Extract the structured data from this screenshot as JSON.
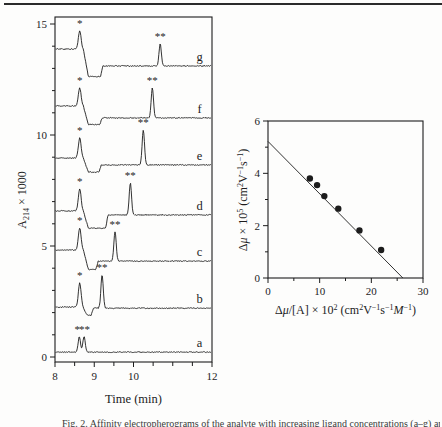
{
  "page": {
    "background": "#fdfdfc",
    "ink": "#1c1c1c",
    "caption": "Fig. 2. Affinity electropherograms of the analyte with increasing ligand concentrations (a–g) and the corresponding plot of Δμ versus Δμ/[A]."
  },
  "chart_data": [
    {
      "id": "affinity-electropherograms",
      "type": "line",
      "title": "",
      "xlabel": "Time (min)",
      "ylabel": "A214 × 1000",
      "xlim": [
        8,
        12
      ],
      "ylim": [
        0,
        15
      ],
      "xticks": [
        8,
        9,
        10,
        12
      ],
      "xticks_minor_step": 0.5,
      "yticks": [
        0,
        5,
        10,
        15
      ],
      "yticks_minor_step": 1,
      "grid": false,
      "ylabel_parts": [
        {
          "t": "A"
        },
        {
          "t": "214",
          "sub": true
        },
        {
          "t": " × 1000"
        }
      ],
      "traces": [
        {
          "label": "a",
          "baseline_left": 0.22,
          "baseline_right": 0.22,
          "dip": null,
          "peaks": [
            {
              "t": 8.62,
              "h": 0.7,
              "sigma": 0.03
            },
            {
              "t": 8.74,
              "h": 0.7,
              "sigma": 0.03
            }
          ],
          "markers": [
            {
              "t": 8.57,
              "glyph": "*"
            },
            {
              "t": 8.75,
              "glyph": "**"
            }
          ]
        },
        {
          "label": "b",
          "baseline_left": 2.25,
          "baseline_right": 2.2,
          "dip": {
            "start": 8.7,
            "end": 8.98,
            "depth": 0.32
          },
          "peaks": [
            {
              "t": 8.63,
              "h": 1.08,
              "sigma": 0.035
            },
            {
              "t": 9.2,
              "h": 1.49,
              "sigma": 0.03
            }
          ],
          "markers": [
            {
              "t": 8.63,
              "glyph": "*"
            },
            {
              "t": 9.2,
              "glyph": "**"
            }
          ]
        },
        {
          "label": "c",
          "baseline_left": 4.82,
          "baseline_right": 4.32,
          "dip": {
            "start": 8.72,
            "end": 9.1,
            "depth": 0.38
          },
          "peaks": [
            {
              "t": 8.63,
              "h": 1.0,
              "sigma": 0.035
            },
            {
              "t": 9.53,
              "h": 1.31,
              "sigma": 0.03
            }
          ],
          "markers": [
            {
              "t": 8.63,
              "glyph": "*"
            },
            {
              "t": 9.53,
              "glyph": "**"
            }
          ]
        },
        {
          "label": "d",
          "baseline_left": 6.58,
          "baseline_right": 6.4,
          "dip": {
            "start": 8.72,
            "end": 9.35,
            "depth": 0.6
          },
          "peaks": [
            {
              "t": 8.63,
              "h": 1.0,
              "sigma": 0.035
            },
            {
              "t": 9.92,
              "h": 1.44,
              "sigma": 0.03
            }
          ],
          "markers": [
            {
              "t": 8.63,
              "glyph": "*"
            },
            {
              "t": 9.92,
              "glyph": "**"
            }
          ]
        },
        {
          "label": "e",
          "baseline_left": 8.96,
          "baseline_right": 8.65,
          "dip": {
            "start": 8.72,
            "end": 9.18,
            "depth": 0.32
          },
          "peaks": [
            {
              "t": 8.63,
              "h": 0.9,
              "sigma": 0.035
            },
            {
              "t": 10.25,
              "h": 1.58,
              "sigma": 0.03
            }
          ],
          "markers": [
            {
              "t": 8.63,
              "glyph": "*"
            },
            {
              "t": 10.25,
              "glyph": "**"
            }
          ]
        },
        {
          "label": "f",
          "baseline_left": 11.31,
          "baseline_right": 10.77,
          "dip": {
            "start": 8.72,
            "end": 9.2,
            "depth": 0.3
          },
          "peaks": [
            {
              "t": 8.63,
              "h": 0.81,
              "sigma": 0.035
            },
            {
              "t": 10.48,
              "h": 1.35,
              "sigma": 0.03
            }
          ],
          "markers": [
            {
              "t": 8.63,
              "glyph": "*"
            },
            {
              "t": 10.48,
              "glyph": "**"
            }
          ]
        },
        {
          "label": "g",
          "baseline_left": 13.87,
          "baseline_right": 13.11,
          "dip": {
            "start": 8.72,
            "end": 9.22,
            "depth": 0.48
          },
          "peaks": [
            {
              "t": 8.63,
              "h": 0.81,
              "sigma": 0.035
            },
            {
              "t": 10.68,
              "h": 0.99,
              "sigma": 0.03
            }
          ],
          "markers": [
            {
              "t": 8.63,
              "glyph": "*"
            },
            {
              "t": 10.68,
              "glyph": "**"
            }
          ]
        }
      ]
    },
    {
      "id": "mobility-shift-plot",
      "type": "scatter",
      "title": "",
      "xlabel": "Δμ/[A] × 10² (cm²V⁻¹s⁻¹M⁻¹)",
      "ylabel": "Δμ × 10⁵ (cm²V⁻¹s⁻¹)",
      "xlim": [
        0,
        30
      ],
      "ylim": [
        0,
        6
      ],
      "xticks": [
        0,
        10,
        20,
        30
      ],
      "xticks_minor": [
        5,
        15,
        25
      ],
      "yticks": [
        0,
        2,
        4,
        6
      ],
      "yticks_minor": [
        1,
        3,
        5
      ],
      "grid": false,
      "legend": null,
      "points": [
        [
          8.1,
          3.8
        ],
        [
          9.5,
          3.55
        ],
        [
          10.9,
          3.13
        ],
        [
          13.6,
          2.65
        ],
        [
          17.7,
          1.82
        ],
        [
          21.9,
          1.07
        ]
      ],
      "fit_line": {
        "y_intercept": 5.22,
        "x_at_y0": 26.1,
        "slope": -0.2
      },
      "xlabel_parts": [
        {
          "t": "Δ"
        },
        {
          "t": "μ",
          "italic": true
        },
        {
          "t": "/[A] × 10"
        },
        {
          "t": "2",
          "sup": true
        },
        {
          "t": " (cm"
        },
        {
          "t": "2",
          "sup": true
        },
        {
          "t": "V"
        },
        {
          "t": "−1",
          "sup": true
        },
        {
          "t": "s"
        },
        {
          "t": "−1",
          "sup": true
        },
        {
          "t": "M",
          "italic": true
        },
        {
          "t": "−1",
          "sup": true
        },
        {
          "t": ")"
        }
      ],
      "ylabel_parts": [
        {
          "t": "Δ"
        },
        {
          "t": "μ",
          "italic": true
        },
        {
          "t": " × 10"
        },
        {
          "t": "5",
          "sup": true
        },
        {
          "t": " (cm"
        },
        {
          "t": "2",
          "sup": true
        },
        {
          "t": "V"
        },
        {
          "t": "−1",
          "sup": true
        },
        {
          "t": "s"
        },
        {
          "t": "−1",
          "sup": true
        },
        {
          "t": ")"
        }
      ]
    }
  ]
}
